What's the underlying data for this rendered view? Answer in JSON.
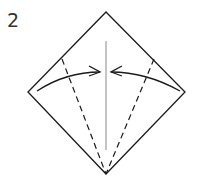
{
  "diagram": {
    "step_number": "2",
    "type": "origami-fold-step",
    "elements": {
      "square_outline": "diamond",
      "center_crease": "valley reference line",
      "fold_lines": [
        "left dashed valley fold",
        "right dashed valley fold"
      ],
      "arrows": [
        "left edge folds to center",
        "right edge folds to center"
      ]
    },
    "colors": {
      "stroke": "#1a1a1a",
      "crease": "#888888"
    }
  }
}
